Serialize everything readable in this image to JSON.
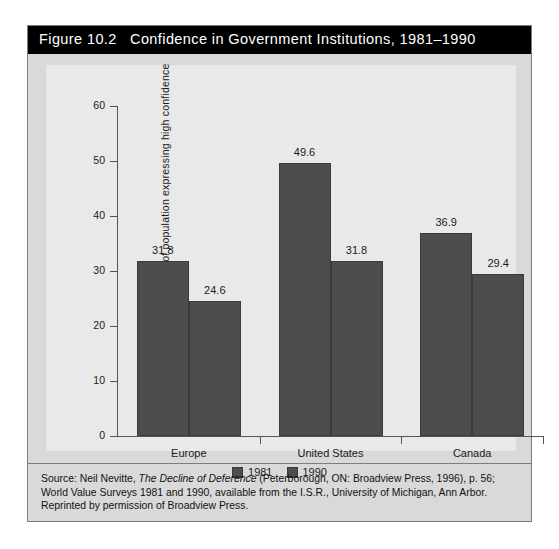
{
  "figure": {
    "title": "Figure 10.2   Confidence in Government Institutions, 1981–1990",
    "title_bar_color": "#000000",
    "title_text_color": "#ffffff",
    "panel_color": "#d9d9d9",
    "plot_background": "#e9e9e9",
    "border_color": "#7d7d7d"
  },
  "source": {
    "prefix": "Source: Neil Nevitte, ",
    "italic_title": "The Decline of Deference",
    "suffix": " (Peterborough, ON: Broadview Press, 1996), p. 56; World Value Surveys 1981 and 1990, available from the I.S.R., University of Michigan, Ann Arbor. Reprinted by permission of Broadview Press."
  },
  "legend": {
    "position": "bottom-center",
    "entries": [
      {
        "label": "1981",
        "color": "#4d4d4d"
      },
      {
        "label": "1990",
        "color": "#4d4d4d"
      }
    ]
  },
  "chart_data": {
    "type": "bar",
    "title": "Confidence in Government Institutions, 1981–1990",
    "xlabel": "",
    "ylabel": "Percent of population expressing high confidence",
    "ylim": [
      0,
      60
    ],
    "yticks": [
      0,
      10,
      20,
      30,
      40,
      50,
      60
    ],
    "ytick_labels": [
      "0",
      "10",
      "20",
      "30",
      "40",
      "50",
      "60"
    ],
    "grid": false,
    "categories": [
      "Europe",
      "United States",
      "Canada"
    ],
    "series": [
      {
        "name": "1981",
        "color": "#4d4d4d",
        "values": [
          31.8,
          49.6,
          36.9
        ]
      },
      {
        "name": "1990",
        "color": "#4d4d4d",
        "values": [
          24.6,
          31.8,
          29.4
        ]
      }
    ],
    "data_labels": [
      [
        "31.8",
        "24.6"
      ],
      [
        "49.6",
        "31.8"
      ],
      [
        "36.9",
        "29.4"
      ]
    ]
  }
}
